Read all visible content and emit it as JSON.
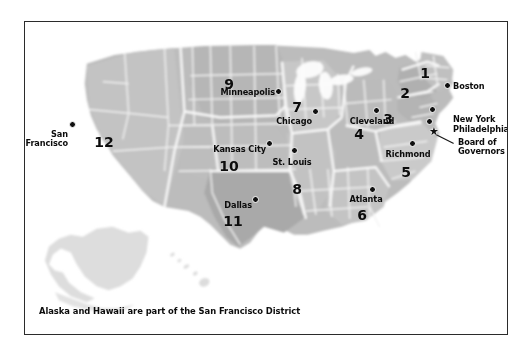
{
  "figure": {
    "caption": "Alaska and Hawaii are part of the San Francisco District",
    "frame_color": "#2b2b2b",
    "background_color": "#ffffff"
  },
  "colors": {
    "land": "#b9b9b9",
    "land_dark": "#a8a8a8",
    "land_light": "#cccccc",
    "faded": "#dedede",
    "state_border": "#f4f4f4",
    "text": "#0c0c0c",
    "dot": "#101010"
  },
  "districts": [
    {
      "number": "1",
      "bank": "Boston",
      "x": 400,
      "y": 44
    },
    {
      "number": "2",
      "bank": "New York",
      "x": 380,
      "y": 64
    },
    {
      "number": "3",
      "bank": "Philadelphia",
      "x": 363,
      "y": 90
    },
    {
      "number": "4",
      "bank": "Cleveland",
      "x": 334,
      "y": 105
    },
    {
      "number": "5",
      "bank": "Richmond",
      "x": 381,
      "y": 143
    },
    {
      "number": "6",
      "bank": "Atlanta",
      "x": 337,
      "y": 186
    },
    {
      "number": "7",
      "bank": "Chicago",
      "x": 272,
      "y": 78
    },
    {
      "number": "8",
      "bank": "St. Louis",
      "x": 272,
      "y": 160
    },
    {
      "number": "9",
      "bank": "Minneapolis",
      "x": 204,
      "y": 55
    },
    {
      "number": "10",
      "bank": "Kansas City",
      "x": 204,
      "y": 137
    },
    {
      "number": "11",
      "bank": "Dallas",
      "x": 208,
      "y": 192
    },
    {
      "number": "12",
      "bank": "San Francisco",
      "x": 79,
      "y": 113
    }
  ],
  "city_markers": [
    {
      "name": "Boston",
      "dot_x": 423,
      "dot_y": 64,
      "label": "Boston",
      "label_x": 428,
      "label_y": 60,
      "align": "l"
    },
    {
      "name": "New York",
      "dot_x": 408,
      "dot_y": 88,
      "label": "New York",
      "label_x": 428,
      "label_y": 93,
      "align": "l"
    },
    {
      "name": "Philadelphia",
      "dot_x": 405,
      "dot_y": 100,
      "label": "Philadelphia",
      "label_x": 428,
      "label_y": 103,
      "align": "l"
    },
    {
      "name": "Cleveland",
      "dot_x": 352,
      "dot_y": 89,
      "label": "Cleveland",
      "label_x": 347,
      "label_y": 95,
      "align": "c"
    },
    {
      "name": "Richmond",
      "dot_x": 388,
      "dot_y": 122,
      "label": "Richmond",
      "label_x": 383,
      "label_y": 128,
      "align": "c"
    },
    {
      "name": "Atlanta",
      "dot_x": 348,
      "dot_y": 168,
      "label": "Atlanta",
      "label_x": 341,
      "label_y": 173,
      "align": "c"
    },
    {
      "name": "Chicago",
      "dot_x": 291,
      "dot_y": 90,
      "label": "Chicago",
      "label_x": 287,
      "label_y": 95,
      "align": "r"
    },
    {
      "name": "St. Louis",
      "dot_x": 270,
      "dot_y": 129,
      "label": "St. Louis",
      "label_x": 267,
      "label_y": 136,
      "align": "c"
    },
    {
      "name": "Minneapolis",
      "dot_x": 254,
      "dot_y": 70,
      "label": "Minneapolis",
      "label_x": 250,
      "label_y": 66,
      "align": "r"
    },
    {
      "name": "Kansas City",
      "dot_x": 245,
      "dot_y": 122,
      "label": "Kansas City",
      "label_x": 241,
      "label_y": 123,
      "align": "r"
    },
    {
      "name": "Dallas",
      "dot_x": 231,
      "dot_y": 178,
      "label": "Dallas",
      "label_x": 227,
      "label_y": 179,
      "align": "r"
    },
    {
      "name": "San Francisco",
      "dot_x": 48,
      "dot_y": 103,
      "label": "San\nFrancisco",
      "label_x": 43,
      "label_y": 108,
      "align": "r"
    }
  ],
  "board_of_governors": {
    "marker_glyph": "★",
    "marker_x": 409,
    "marker_y": 110,
    "label": "Board of\nGovernors",
    "label_x": 433,
    "label_y": 116,
    "leader_line": {
      "x1": 412,
      "y1": 113,
      "x2": 430,
      "y2": 122
    }
  }
}
